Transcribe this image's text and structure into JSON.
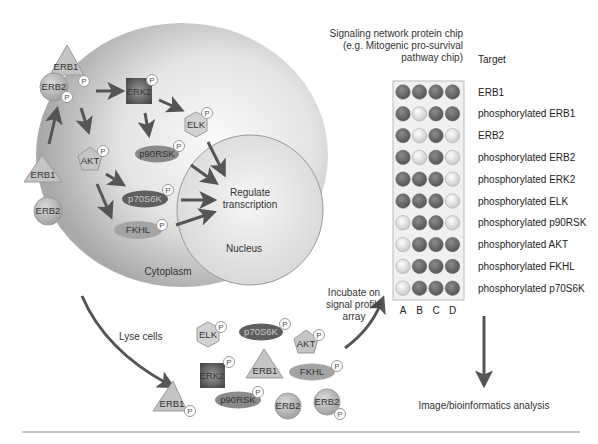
{
  "cell": {
    "cytoplasm_label": "Cytoplasm",
    "nucleus_label": "Nucleus",
    "nucleus_action": [
      "Regulate",
      "transcription"
    ]
  },
  "phospho_marker": "P",
  "cell_proteins": {
    "erb1_top": "ERB1",
    "erb2_top": "ERB2",
    "erb1_bottom": "ERB1",
    "erb2_bottom": "ERB2",
    "erk2": "ERK2",
    "elk": "ELK",
    "akt": "AKT",
    "p90rsk": "p90RSK",
    "p70s6k": "p70S6K",
    "fkhl": "FKHL"
  },
  "lysate_proteins": {
    "elk": "ELK",
    "p70s6k": "p70S6K",
    "akt": "AKT",
    "erk2": "ERK2",
    "erb1_center": "ERB1",
    "fkhl": "FKHL",
    "erb1_left": "ERB1",
    "p90rsk": "p90RSK",
    "erb2_plain": "ERB2",
    "erb2_phos": "ERB2"
  },
  "steps": {
    "lyse": "Lyse cells",
    "incubate": [
      "Incubate on",
      "signal profile",
      "array"
    ],
    "analysis": "Image/bioinformatics analysis"
  },
  "chip": {
    "title": [
      "Signaling network protein chip",
      "(e.g. Mitogenic pro-survival",
      "pathway chip)"
    ],
    "target_header": "Target",
    "columns": [
      "A",
      "B",
      "C",
      "D"
    ],
    "rows": [
      {
        "target": "ERB1",
        "spots": [
          "dark",
          "dark",
          "dark",
          "dark"
        ]
      },
      {
        "target": "phosphorylated ERB1",
        "spots": [
          "dark",
          "light",
          "dark",
          "dark"
        ]
      },
      {
        "target": "ERB2",
        "spots": [
          "dark",
          "light",
          "dark",
          "light"
        ]
      },
      {
        "target": "phosphorylated ERB2",
        "spots": [
          "dark",
          "light",
          "dark",
          "light"
        ]
      },
      {
        "target": "phosphorylated ERK2",
        "spots": [
          "dark",
          "dark",
          "dark",
          "light"
        ]
      },
      {
        "target": "phosphorylated ELK",
        "spots": [
          "dark",
          "dark",
          "dark",
          "light"
        ]
      },
      {
        "target": "phosphorylated p90RSK",
        "spots": [
          "light",
          "dark",
          "dark",
          "light"
        ]
      },
      {
        "target": "phosphorylated AKT",
        "spots": [
          "light",
          "dark",
          "dark",
          "dark"
        ]
      },
      {
        "target": "phosphorylated FKHL",
        "spots": [
          "light",
          "dark",
          "dark",
          "dark"
        ]
      },
      {
        "target": "phosphorylated p70S6K",
        "spots": [
          "light",
          "dark",
          "dark",
          "dark"
        ]
      }
    ]
  },
  "colors": {
    "cell_edge": "#a8a8a8",
    "cell_center": "#f4f4f4",
    "protein_light": "#c8c8c8",
    "protein_dark": "#6e6e6e",
    "spot_dark": "#6a6a6a",
    "spot_light": "#f2f2f2",
    "arrow": "#555555"
  }
}
